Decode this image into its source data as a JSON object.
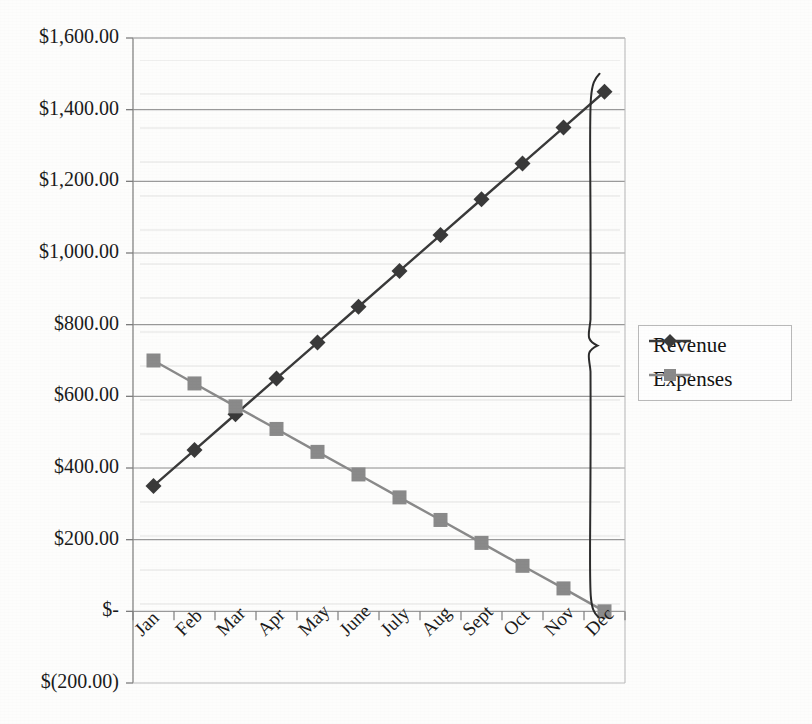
{
  "chart_data": {
    "type": "line",
    "title": "",
    "subtitle": "",
    "xlabel": "",
    "ylabel": "",
    "categories": [
      "Jan",
      "Feb",
      "Mar",
      "Apr",
      "May",
      "June",
      "July",
      "Aug",
      "Sept",
      "Oct",
      "Nov",
      "Dec"
    ],
    "series": [
      {
        "name": "Revenue",
        "color": "#3a3a3a",
        "marker": "diamond",
        "values": [
          350,
          450,
          550,
          650,
          750,
          850,
          950,
          1050,
          1150,
          1250,
          1350,
          1450
        ]
      },
      {
        "name": "Expenses",
        "color": "#8a8a8a",
        "marker": "square",
        "values": [
          700,
          636,
          572,
          509,
          445,
          382,
          318,
          255,
          191,
          127,
          64,
          0
        ]
      }
    ],
    "ylim": [
      -200,
      1600
    ],
    "ytick_values": [
      -200,
      0,
      200,
      400,
      600,
      800,
      1000,
      1200,
      1400,
      1600
    ],
    "ytick_labels": [
      "$(200.00)",
      "$-",
      "$200.00",
      "$400.00",
      "$600.00",
      "$800.00",
      "$1,000.00",
      "$1,200.00",
      "$1,400.00",
      "$1,600.00"
    ],
    "grid": true,
    "grid_axis": "y",
    "legend_position": "right",
    "annotations": [
      {
        "type": "brace",
        "label": "",
        "target_series": "Revenue-to-Expenses gap at Dec",
        "from_value": 1450,
        "to_value": 0,
        "category": "Dec"
      }
    ]
  },
  "legend": {
    "items": [
      {
        "label": "Revenue",
        "marker": "diamond",
        "color": "#3a3a3a"
      },
      {
        "label": "Expenses",
        "marker": "square",
        "color": "#8a8a8a"
      }
    ]
  },
  "axes": {
    "y_labels": [
      "$1,600.00",
      "$1,400.00",
      "$1,200.00",
      "$1,000.00",
      "$800.00",
      "$600.00",
      "$400.00",
      "$200.00",
      "$-",
      "$(200.00)"
    ],
    "x_labels": [
      "Jan",
      "Feb",
      "Mar",
      "Apr",
      "May",
      "June",
      "July",
      "Aug",
      "Sept",
      "Oct",
      "Nov",
      "Dec"
    ]
  }
}
